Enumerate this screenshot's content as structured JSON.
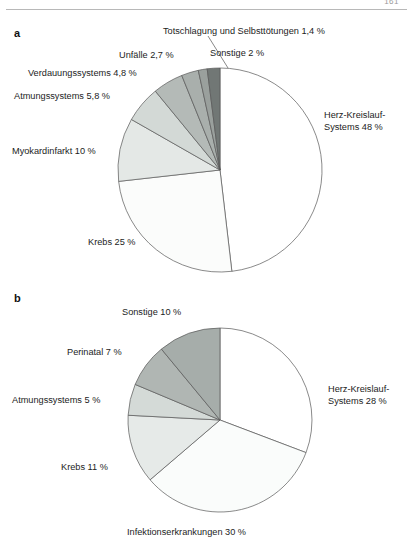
{
  "page": {
    "number": "161",
    "panels": [
      {
        "letter": "a"
      },
      {
        "letter": "b"
      }
    ]
  },
  "chart_data": [
    {
      "id": "chart-a",
      "type": "pie",
      "title": "a",
      "start_angle_deg": 0,
      "direction": "clockwise",
      "center": {
        "x": 220,
        "y": 170
      },
      "radius": 102,
      "legend_position": "outside-labels",
      "grid": false,
      "categories": [
        "Herz-Kreislauf-Systems",
        "Krebs",
        "Myokardinfarkt",
        "Atmungssystems",
        "Verdauungssystems",
        "Unfälle",
        "Totschlagung und Selbsttötungen",
        "Sonstige"
      ],
      "values": [
        48,
        25,
        10,
        5.8,
        4.8,
        2.7,
        1.4,
        2
      ],
      "slices": [
        {
          "label": "Herz-Kreislauf-Systems 48 %",
          "name": "Herz-Kreislauf-Systems",
          "value": 48,
          "value_text": "48 %",
          "color": "#ffffff"
        },
        {
          "label": "Krebs 25 %",
          "name": "Krebs",
          "value": 25,
          "value_text": "25 %",
          "color": "#fbfcfb"
        },
        {
          "label": "Myokardinfarkt 10 %",
          "name": "Myokardinfarkt",
          "value": 10,
          "value_text": "10 %",
          "color": "#e4e8e6"
        },
        {
          "label": "Atmungssystems 5,8 %",
          "name": "Atmungssystems",
          "value": 5.8,
          "value_text": "5,8 %",
          "color": "#d3d9d6"
        },
        {
          "label": "Verdauungssystems 4,8 %",
          "name": "Verdauungssystems",
          "value": 4.8,
          "value_text": "4,8 %",
          "color": "#b4bab7"
        },
        {
          "label": "Unfälle 2,7 %",
          "name": "Unfälle",
          "value": 2.7,
          "value_text": "2,7 %",
          "color": "#a9afac"
        },
        {
          "label": "Totschlagung und Selbsttötungen 1,4 %",
          "name": "Totschlagung und Selbsttötungen",
          "value": 1.4,
          "value_text": "1,4 %",
          "color": "#9aa09d"
        },
        {
          "label": "Sonstige 2 %",
          "name": "Sonstige",
          "value": 2,
          "value_text": "2 %",
          "color": "#717775"
        }
      ]
    },
    {
      "id": "chart-b",
      "type": "pie",
      "title": "b",
      "start_angle_deg": 0,
      "direction": "clockwise",
      "center": {
        "x": 220,
        "y": 420
      },
      "radius": 92,
      "legend_position": "outside-labels",
      "grid": false,
      "categories": [
        "Herz-Kreislauf-Systems",
        "Infektionserkrankungen",
        "Krebs",
        "Atmungssystems",
        "Perinatal",
        "Sonstige"
      ],
      "values": [
        28,
        30,
        11,
        5,
        7,
        10
      ],
      "slices": [
        {
          "label": "Herz-Kreislauf-Systems 28 %",
          "name": "Herz-Kreislauf-Systems",
          "value": 28,
          "value_text": "28 %",
          "color": "#ffffff"
        },
        {
          "label": "Infektionserkrankungen 30 %",
          "name": "Infektionserkrankungen",
          "value": 30,
          "value_text": "30 %",
          "color": "#fafcfb"
        },
        {
          "label": "Krebs 11 %",
          "name": "Krebs",
          "value": 11,
          "value_text": "11 %",
          "color": "#e6eae8"
        },
        {
          "label": "Atmungssystems 5 %",
          "name": "Atmungssystems",
          "value": 5,
          "value_text": "5 %",
          "color": "#d4dad7"
        },
        {
          "label": "Perinatal 7 %",
          "name": "Perinatal",
          "value": 7,
          "value_text": "7 %",
          "color": "#b0b6b3"
        },
        {
          "label": "Sonstige 10 %",
          "name": "Sonstige",
          "value": 10,
          "value_text": "10 %",
          "color": "#a6adaa"
        }
      ]
    }
  ],
  "labels_a": {
    "herz_line1": "Herz-Kreislauf-",
    "herz_line2": "Systems 48 %",
    "krebs": "Krebs 25 %",
    "myokard": "Myokardinfarkt 10 %",
    "atmung": "Atmungssystems 5,8 %",
    "verdauung": "Verdauungssystems 4,8 %",
    "unfaelle": "Unfälle 2,7 %",
    "totschlagung": "Totschlagung und Selbsttötungen 1,4 %",
    "sonstige": "Sonstige 2 %"
  },
  "labels_b": {
    "herz_line1": "Herz-Kreislauf-",
    "herz_line2": "Systems 28 %",
    "infektion": "Infektionserkrankungen 30 %",
    "krebs": "Krebs 11 %",
    "atmung": "Atmungssystems 5 %",
    "perinatal": "Perinatal 7 %",
    "sonstige": "Sonstige 10 %"
  }
}
